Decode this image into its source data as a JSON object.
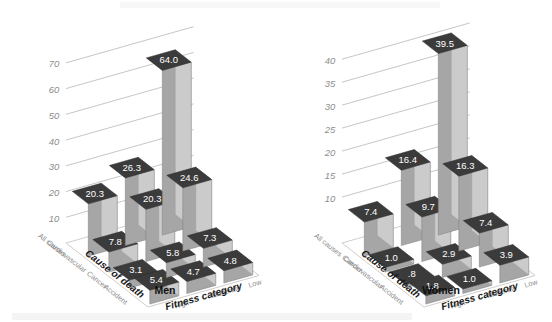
{
  "chart_data": [
    {
      "type": "bar",
      "title": "Men",
      "subtitle": "",
      "xlabel": "Cause of death",
      "zlabel": "Fitness category",
      "ylabel": "",
      "categories": [
        "All causes",
        "Cardiovascular",
        "Cancer",
        "Accident"
      ],
      "series": [
        {
          "name": "Low",
          "values": [
            64.0,
            24.6,
            7.3,
            4.8
          ]
        },
        {
          "name": "Moderate",
          "values": [
            26.3,
            20.3,
            5.8,
            4.7
          ]
        },
        {
          "name": "High",
          "values": [
            20.3,
            7.8,
            3.1,
            5.4
          ]
        }
      ],
      "ylim": [
        0,
        75
      ],
      "yticks": [
        10,
        20,
        30,
        40,
        50,
        60,
        70
      ],
      "grid": true,
      "legend": "none",
      "projection": "3d-isometric"
    },
    {
      "type": "bar",
      "title": "Women",
      "subtitle": "",
      "xlabel": "Cause of death",
      "zlabel": "Fitness category",
      "ylabel": "",
      "categories": [
        "All causes",
        "Cancer",
        "Cardiovascular",
        "Accident"
      ],
      "series": [
        {
          "name": "Low",
          "values": [
            39.5,
            16.3,
            7.4,
            3.9
          ]
        },
        {
          "name": "Moderate",
          "values": [
            16.4,
            9.7,
            2.9,
            1.0
          ]
        },
        {
          "name": "High",
          "values": [
            7.4,
            1.0,
            0.8,
            1.8
          ]
        }
      ],
      "ylim": [
        0,
        42
      ],
      "yticks": [
        10,
        15,
        20,
        25,
        30,
        35,
        40
      ],
      "grid": true,
      "legend": "none",
      "projection": "3d-isometric"
    }
  ],
  "panels": [
    {
      "id": "men",
      "title": "Men",
      "axis_cause_label": "Cause of death",
      "axis_fitness_label": "Fitness category",
      "cause_ticks": [
        "All causes",
        "Cardiovascular",
        "Cancer",
        "Accident"
      ],
      "fitness_ticks": [
        "High",
        "Moderate",
        "Low"
      ],
      "value_ticks": [
        "10",
        "20",
        "30",
        "40",
        "50",
        "60",
        "70"
      ],
      "value_tick_numbers": [
        10,
        20,
        30,
        40,
        50,
        60,
        70
      ],
      "bar_labels": {
        "low": [
          "64.0",
          "24.6",
          "7.3",
          "4.8"
        ],
        "moderate": [
          "26.3",
          "20.3",
          "5.8",
          "4.7"
        ],
        "high": [
          "20.3",
          "7.8",
          "3.1",
          "5.4"
        ]
      },
      "bar_values": {
        "low": [
          64.0,
          24.6,
          7.3,
          4.8
        ],
        "moderate": [
          26.3,
          20.3,
          5.8,
          4.7
        ],
        "high": [
          20.3,
          7.8,
          3.1,
          5.4
        ]
      },
      "y_max": 75
    },
    {
      "id": "women",
      "title": "Women",
      "axis_cause_label": "Cause of death",
      "axis_fitness_label": "Fitness category",
      "cause_ticks": [
        "All causes",
        "Cancer",
        "Cardiovascular",
        "Accident"
      ],
      "fitness_ticks": [
        "High",
        "Moderate",
        "Low"
      ],
      "value_ticks": [
        "10",
        "15",
        "20",
        "25",
        "30",
        "35",
        "40"
      ],
      "value_tick_numbers": [
        10,
        15,
        20,
        25,
        30,
        35,
        40
      ],
      "bar_labels": {
        "low": [
          "39.5",
          "16.3",
          "7.4",
          "3.9"
        ],
        "moderate": [
          "16.4",
          "9.7",
          "2.9",
          "1.0"
        ],
        "high": [
          "7.4",
          "1.0",
          ".8",
          "1.8"
        ]
      },
      "bar_values": {
        "low": [
          39.5,
          16.3,
          7.4,
          3.9
        ],
        "moderate": [
          16.4,
          9.7,
          2.9,
          1.0
        ],
        "high": [
          7.4,
          1.0,
          0.8,
          1.8
        ]
      },
      "y_max": 42
    }
  ],
  "colors": {
    "bar_top": "#3b3b3b",
    "bar_left": "#a6a6a6",
    "bar_right": "#cbcbcb",
    "bar_top_light": "#6f6f6f",
    "grid": "#b8b8b8",
    "tick_text": "#8d8d8d",
    "cat_text": "#8a8a8a",
    "value_text": "#ffffff",
    "axis_title": "#1a1a1a",
    "background": "#ffffff"
  }
}
